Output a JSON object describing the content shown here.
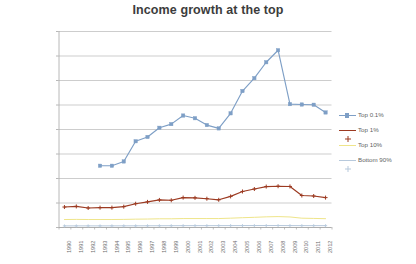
{
  "chart_data": {
    "type": "line",
    "title": "Income growth at the top",
    "xlabel": "",
    "ylabel": "",
    "grid": true,
    "legend_position": "right",
    "ylim": [
      0,
      1600000
    ],
    "ytick_labels": [
      "£0",
      "£200,000",
      "£400,000",
      "£600,000",
      "£800,000",
      "£1,000,000",
      "£1,200,000",
      "£1,400,000",
      "£1,600,000"
    ],
    "ytick_values": [
      0,
      200000,
      400000,
      600000,
      800000,
      1000000,
      1200000,
      1400000,
      1600000
    ],
    "categories": [
      "1990",
      "1991",
      "1992",
      "1993",
      "1994",
      "1995",
      "1996",
      "1997",
      "1998",
      "1999",
      "2000",
      "2001",
      "2002",
      "2003",
      "2004",
      "2005",
      "2006",
      "2007",
      "2008",
      "2009",
      "2010",
      "2011",
      "2012"
    ],
    "series": [
      {
        "name": "Top 0.1%",
        "color": "#7E9FC6",
        "marker": "square",
        "values": [
          null,
          null,
          null,
          500000,
          500000,
          535000,
          700000,
          735000,
          810000,
          840000,
          910000,
          888000,
          832000,
          805000,
          928000,
          1110000,
          1215000,
          1345000,
          1443000,
          1003000,
          1000000,
          998000,
          935000
        ]
      },
      {
        "name": "Top 1%",
        "color": "#9C3A21",
        "marker": "plus",
        "values": [
          163000,
          168000,
          155000,
          158000,
          158000,
          166000,
          190000,
          205000,
          221000,
          218000,
          240000,
          238000,
          231000,
          222000,
          250000,
          290000,
          310000,
          330000,
          333000,
          331000,
          257000,
          253000,
          240000
        ]
      },
      {
        "name": "Top 10%",
        "color": "#EFE58A",
        "marker": "none",
        "values": [
          61000,
          62000,
          61000,
          61000,
          61000,
          62000,
          64000,
          65000,
          67000,
          67000,
          69000,
          69000,
          69000,
          69000,
          72000,
          76000,
          79000,
          83000,
          85000,
          82000,
          72000,
          70000,
          68000
        ]
      },
      {
        "name": "Bottom 90%",
        "color": "#B7C9DC",
        "marker": "dot",
        "values": [
          9000,
          9200,
          9300,
          9300,
          9400,
          9500,
          9800,
          10000,
          10400,
          10600,
          11000,
          11100,
          11200,
          11300,
          11500,
          11700,
          11900,
          12100,
          12000,
          11600,
          11300,
          11200,
          11100
        ]
      }
    ]
  },
  "colors": {
    "background": "#ffffff",
    "gridline": "#b7b7b7",
    "axis": "#a6a6a6",
    "title_text": "#3c3c3c",
    "tick_text": "#6e6e6e",
    "legend_text": "#5f5f5f"
  }
}
